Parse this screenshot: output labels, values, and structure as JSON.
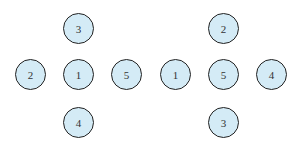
{
  "diagrams": [
    {
      "nodes": [
        {
          "label": "3",
          "x": 79,
          "y": 29
        },
        {
          "label": "2",
          "x": 31,
          "y": 75
        },
        {
          "label": "1",
          "x": 79,
          "y": 75
        },
        {
          "label": "5",
          "x": 127,
          "y": 75
        },
        {
          "label": "4",
          "x": 79,
          "y": 123
        }
      ]
    },
    {
      "nodes": [
        {
          "label": "2",
          "x": 224,
          "y": 29
        },
        {
          "label": "1",
          "x": 176,
          "y": 75
        },
        {
          "label": "5",
          "x": 224,
          "y": 75
        },
        {
          "label": "4",
          "x": 272,
          "y": 75
        },
        {
          "label": "3",
          "x": 224,
          "y": 123
        }
      ]
    }
  ],
  "colors": {
    "fill": "#d4ebf6",
    "stroke": "#222222"
  }
}
